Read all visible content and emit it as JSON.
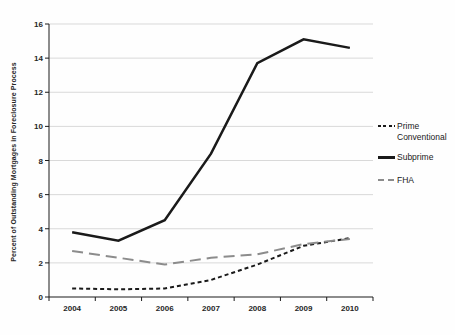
{
  "chart_data": {
    "type": "line",
    "title": "",
    "xlabel": "",
    "ylabel": "Percent of Outstanding Mortgages in Foreclosure Process",
    "categories": [
      "2004",
      "2005",
      "2006",
      "2007",
      "2008",
      "2009",
      "2010"
    ],
    "ylim": [
      0,
      16
    ],
    "yticks": [
      0,
      2,
      4,
      6,
      8,
      10,
      12,
      14,
      16
    ],
    "grid": true,
    "legend_position": "right",
    "colors": {
      "axis": "#1a1a1a",
      "gridline": "#d9d9d9",
      "tick_text": "#262626",
      "black_series": "#1a1a1a",
      "gray_series": "#8c8c8c"
    },
    "series": [
      {
        "name": "Prime Conventional",
        "color": "#1a1a1a",
        "dash": "4 3",
        "width": 2,
        "values": [
          0.5,
          0.45,
          0.5,
          1.0,
          1.9,
          3.0,
          3.45
        ]
      },
      {
        "name": "Subprime",
        "color": "#1a1a1a",
        "dash": "",
        "width": 2.5,
        "values": [
          3.8,
          3.3,
          4.5,
          8.4,
          13.7,
          15.1,
          14.6
        ]
      },
      {
        "name": "FHA",
        "color": "#8c8c8c",
        "dash": "11 6",
        "width": 2,
        "values": [
          2.7,
          2.3,
          1.9,
          2.3,
          2.5,
          3.1,
          3.4
        ]
      }
    ]
  }
}
